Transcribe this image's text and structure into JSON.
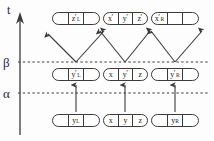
{
  "figure": {
    "axis": {
      "time_axis_label": "t",
      "level_labels": [
        {
          "name": "beta",
          "text": "β"
        },
        {
          "name": "alpha",
          "text": "α"
        }
      ]
    },
    "rows": [
      {
        "name": "top-row",
        "y": 12,
        "capsules": [
          {
            "name": "top-left-capsule",
            "x": 52,
            "width": 48,
            "cells": [
              {
                "name": "cell-empty",
                "base": "",
                "prime": "",
                "sub": ""
              },
              {
                "name": "cell-z-prime-L",
                "base": "z",
                "prime": "′",
                "sub": "L"
              },
              {
                "name": "cell-empty",
                "base": "",
                "prime": "",
                "sub": ""
              }
            ]
          },
          {
            "name": "top-middle-capsule",
            "x": 103,
            "width": 45,
            "cells": [
              {
                "name": "cell-x-prime",
                "base": "x",
                "prime": "′",
                "sub": ""
              },
              {
                "name": "cell-y-prime",
                "base": "y",
                "prime": "′",
                "sub": ""
              },
              {
                "name": "cell-z-prime",
                "base": "z",
                "prime": "′",
                "sub": ""
              }
            ]
          },
          {
            "name": "top-right-capsule",
            "x": 151,
            "width": 48,
            "cells": [
              {
                "name": "cell-x-prime-R",
                "base": "x",
                "prime": "′",
                "sub": "R"
              },
              {
                "name": "cell-empty",
                "base": "",
                "prime": "",
                "sub": ""
              },
              {
                "name": "cell-empty",
                "base": "",
                "prime": "",
                "sub": ""
              }
            ]
          }
        ]
      },
      {
        "name": "beta-row",
        "y": 68,
        "capsules": [
          {
            "name": "beta-left-capsule",
            "x": 52,
            "width": 48,
            "cells": [
              {
                "name": "cell-empty",
                "base": "",
                "prime": "",
                "sub": ""
              },
              {
                "name": "cell-y-prime-L",
                "base": "y",
                "prime": "′",
                "sub": "L"
              },
              {
                "name": "cell-empty",
                "base": "",
                "prime": "",
                "sub": ""
              }
            ]
          },
          {
            "name": "beta-middle-capsule",
            "x": 103,
            "width": 45,
            "cells": [
              {
                "name": "cell-x",
                "base": "x",
                "prime": "",
                "sub": ""
              },
              {
                "name": "cell-y-prime",
                "base": "y",
                "prime": "′",
                "sub": ""
              },
              {
                "name": "cell-z",
                "base": "z",
                "prime": "",
                "sub": ""
              }
            ]
          },
          {
            "name": "beta-right-capsule",
            "x": 151,
            "width": 48,
            "cells": [
              {
                "name": "cell-empty",
                "base": "",
                "prime": "",
                "sub": ""
              },
              {
                "name": "cell-y-prime-R",
                "base": "y",
                "prime": "′",
                "sub": "R"
              },
              {
                "name": "cell-empty",
                "base": "",
                "prime": "",
                "sub": ""
              }
            ]
          }
        ]
      },
      {
        "name": "bottom-row",
        "y": 114,
        "capsules": [
          {
            "name": "bottom-left-capsule",
            "x": 52,
            "width": 48,
            "cells": [
              {
                "name": "cell-empty",
                "base": "",
                "prime": "",
                "sub": ""
              },
              {
                "name": "cell-y-L",
                "base": "y",
                "prime": "",
                "sub": "L"
              },
              {
                "name": "cell-empty",
                "base": "",
                "prime": "",
                "sub": ""
              }
            ]
          },
          {
            "name": "bottom-middle-capsule",
            "x": 103,
            "width": 45,
            "cells": [
              {
                "name": "cell-x",
                "base": "x",
                "prime": "",
                "sub": ""
              },
              {
                "name": "cell-y",
                "base": "y",
                "prime": "",
                "sub": ""
              },
              {
                "name": "cell-z",
                "base": "z",
                "prime": "",
                "sub": ""
              }
            ]
          },
          {
            "name": "bottom-right-capsule",
            "x": 151,
            "width": 48,
            "cells": [
              {
                "name": "cell-empty",
                "base": "",
                "prime": "",
                "sub": ""
              },
              {
                "name": "cell-y-R",
                "base": "y",
                "prime": "",
                "sub": "R"
              },
              {
                "name": "cell-empty",
                "base": "",
                "prime": "",
                "sub": ""
              }
            ]
          }
        ]
      }
    ],
    "colors": {
      "stroke": "#3b3b3b",
      "text": "#1d1d1d",
      "background": "#fdfdfd"
    }
  }
}
